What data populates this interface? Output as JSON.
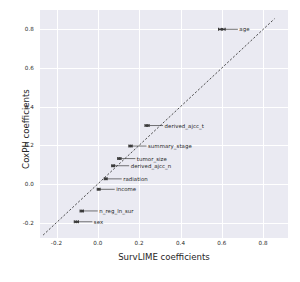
{
  "chart_data": {
    "type": "scatter",
    "title": "",
    "xlabel": "SurvLIME coefficients",
    "ylabel": "CoxPH coefficients",
    "xlim": [
      -0.28,
      0.92
    ],
    "ylim": [
      -0.28,
      0.9
    ],
    "grid": true,
    "legend": "none",
    "xticks": [
      "-0.2",
      "0.0",
      "0.2",
      "0.4",
      "0.6",
      "0.8"
    ],
    "xtick_values": [
      -0.2,
      0.0,
      0.2,
      0.4,
      0.6,
      0.8
    ],
    "yticks": [
      "-0.2",
      "0.0",
      "0.2",
      "0.4",
      "0.6",
      "0.8"
    ],
    "ytick_values": [
      -0.2,
      0.0,
      0.2,
      0.4,
      0.6,
      0.8
    ],
    "reference_line": {
      "style": "dashed",
      "description": "identity line y = x",
      "x0": -0.265,
      "y0": -0.265,
      "x1": 0.855,
      "y1": 0.855
    },
    "marker_color": "#3b3b3b",
    "errorbar_color": "#3b3b3b",
    "points": [
      {
        "label": "age",
        "x": 0.6,
        "y": 0.8,
        "xerr": 0.016,
        "label_side": "right"
      },
      {
        "label": "derived_ajcc_t",
        "x": 0.238,
        "y": 0.302,
        "xerr": 0.01,
        "label_side": "right"
      },
      {
        "label": "summary_stage",
        "x": 0.158,
        "y": 0.196,
        "xerr": 0.008,
        "label_side": "right"
      },
      {
        "label": "tumor_size",
        "x": 0.104,
        "y": 0.131,
        "xerr": 0.008,
        "label_side": "right"
      },
      {
        "label": "derived_ajcc_n",
        "x": 0.074,
        "y": 0.094,
        "xerr": 0.007,
        "label_side": "right"
      },
      {
        "label": "radiation",
        "x": 0.038,
        "y": 0.026,
        "xerr": 0.007,
        "label_side": "right"
      },
      {
        "label": "income",
        "x": 0.004,
        "y": -0.028,
        "xerr": 0.007,
        "label_side": "right"
      },
      {
        "label": "n_reg_ln_sur",
        "x": -0.078,
        "y": -0.14,
        "xerr": 0.008,
        "label_side": "right"
      },
      {
        "label": "sex",
        "x": -0.104,
        "y": -0.196,
        "xerr": 0.01,
        "label_side": "right"
      }
    ]
  },
  "style": {
    "axes_facecolor": "#eaeaf2",
    "figure_facecolor": "#ffffff",
    "gridcolor": "#ffffff",
    "textcolor": "#262626"
  }
}
